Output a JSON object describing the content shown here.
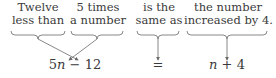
{
  "phrases": [
    {
      "line1": "Twelve",
      "line2": "less than"
    },
    {
      "line1": "5 times",
      "line2": "a number"
    },
    {
      "line1": "is the",
      "line2": "same as"
    },
    {
      "line1": "the number",
      "line2": "increased by 4."
    }
  ],
  "expressions": {
    "left": {
      "coef": "5",
      "var": "n",
      "op": "−",
      "const": "12"
    },
    "equals": "=",
    "right": {
      "var": "n",
      "op": "+",
      "const": "4"
    }
  },
  "colors": {
    "text": "#3a3a3a",
    "lines": "#6a6a6a"
  }
}
